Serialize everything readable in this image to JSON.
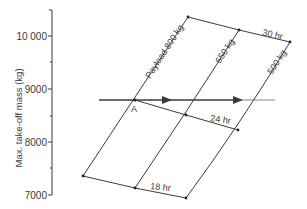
{
  "diagram": {
    "y_axis": {
      "title": "Max. take-off mass (kg)",
      "ticks": [
        {
          "value": "10 000",
          "y": 36
        },
        {
          "value": "9000",
          "y": 89
        },
        {
          "value": "8000",
          "y": 142
        },
        {
          "value": "7000",
          "y": 195
        }
      ],
      "minor_ticks_y": [
        10,
        62,
        116,
        168
      ]
    },
    "payload_lines": [
      {
        "label": "Payload 800 kg",
        "points": [
          [
            188,
            17
          ],
          [
            162,
            58
          ],
          [
            135,
            100
          ],
          [
            109,
            138
          ],
          [
            83,
            176
          ]
        ]
      },
      {
        "label": "650 kg",
        "points": [
          [
            239,
            30
          ],
          [
            213,
            72
          ],
          [
            186,
            115
          ],
          [
            161,
            152
          ],
          [
            135,
            188
          ]
        ]
      },
      {
        "label": "500 kg",
        "points": [
          [
            290,
            42
          ],
          [
            264,
            86
          ],
          [
            238,
            130
          ],
          [
            213,
            166
          ],
          [
            186,
            198
          ]
        ]
      }
    ],
    "endurance_lines": [
      {
        "label": "30 hr",
        "points": [
          [
            188,
            17
          ],
          [
            239,
            30
          ],
          [
            290,
            42
          ]
        ]
      },
      {
        "label": "24 hr",
        "points": [
          [
            135,
            100
          ],
          [
            186,
            115
          ],
          [
            238,
            130
          ]
        ]
      },
      {
        "label": "18 hr",
        "points": [
          [
            83,
            176
          ],
          [
            135,
            188
          ],
          [
            186,
            198
          ]
        ]
      }
    ],
    "reference_line": {
      "x1": 99,
      "x2": 275,
      "y": 100
    },
    "point_label": "A",
    "colors": {
      "line": "#3a3a3a",
      "faded": "#b0b0b0",
      "text": "#3a3a3a"
    }
  }
}
